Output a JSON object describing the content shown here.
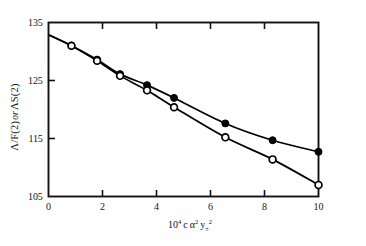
{
  "chart_data": {
    "type": "line",
    "title": "",
    "subtitle": "",
    "xlabel": "10⁴ c α² y±²",
    "ylabel": "Λ/F(2) or ΛS(2)",
    "xlim": [
      0,
      10
    ],
    "ylim": [
      105,
      135
    ],
    "grid": false,
    "legend": "none",
    "xticks": [
      0,
      2,
      4,
      6,
      8,
      10
    ],
    "xtick_labels": [
      "0",
      "2",
      "4",
      "6",
      "8",
      "10"
    ],
    "yticks": [
      105,
      115,
      125,
      135
    ],
    "ytick_labels": [
      "105",
      "115",
      "125",
      "135"
    ],
    "series": [
      {
        "name": "filled-circles",
        "marker": "filled-circle",
        "color": "#000000",
        "x": [
          0.85,
          1.8,
          2.65,
          3.65,
          4.65,
          6.55,
          8.3,
          10.0
        ],
        "values": [
          131.0,
          128.6,
          126.1,
          124.2,
          122.0,
          117.6,
          114.7,
          112.7
        ],
        "fit_x": [
          0.0,
          0.85,
          1.8,
          2.65,
          3.65,
          4.65,
          6.55,
          8.3,
          10.0
        ],
        "fit_values": [
          132.9,
          131.0,
          128.6,
          126.1,
          124.2,
          122.0,
          117.6,
          114.7,
          112.7
        ]
      },
      {
        "name": "open-circles",
        "marker": "open-circle",
        "color": "#000000",
        "x": [
          0.85,
          1.8,
          2.65,
          3.65,
          4.65,
          6.55,
          8.3,
          10.0
        ],
        "values": [
          131.0,
          128.4,
          125.8,
          123.3,
          120.4,
          115.2,
          111.4,
          107.0
        ],
        "fit_x": [
          0.0,
          0.85,
          1.8,
          2.65,
          3.65,
          4.65,
          6.55,
          8.3,
          10.0
        ],
        "fit_values": [
          132.9,
          131.0,
          128.4,
          125.8,
          123.3,
          120.4,
          115.2,
          111.4,
          107.0
        ]
      }
    ]
  },
  "axes": {
    "ylabel_parts": {
      "lambda_over_f": "Λ/F(2)",
      "or": "or",
      "lambda_s": "ΛS(2)"
    },
    "xlabel_parts": {
      "ten": "10",
      "exp4": "4",
      "c": "c",
      "alpha": "α",
      "exp2a": "2",
      "y": "y",
      "pm": "±",
      "exp2b": "2"
    }
  }
}
